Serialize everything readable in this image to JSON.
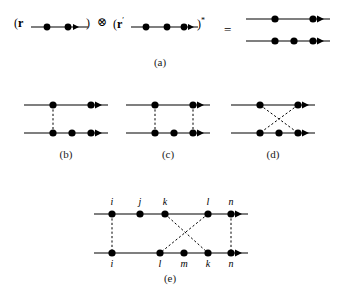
{
  "figure": {
    "caption_labels": [
      "(a)",
      "(b)",
      "(c)",
      "(d)",
      "(e)"
    ],
    "equation_symbols": {
      "tensor_product": "⊗",
      "equals": "=",
      "conjugate": "*",
      "open_paren": "(",
      "close_paren": ")"
    }
  },
  "panel_a": {
    "label": "(a)",
    "left_term_prefix": "(",
    "left_term_symbol": "r",
    "tensor_symbol": "⊗",
    "right_term_prefix": "(",
    "right_term_symbol": "r",
    "right_term_prime": "′",
    "right_term_conjugate": "*",
    "equals": "=",
    "left_propagator_vertices": 2,
    "right_propagator_vertices": 3,
    "result_top_line_vertices": 2,
    "result_bottom_line_vertices": 3
  },
  "panel_b": {
    "label": "(b)",
    "top_vertices": 2,
    "bottom_vertices": 3,
    "interaction_lines": [
      {
        "from": "top-1",
        "to": "bottom-1",
        "style": "dashed"
      }
    ]
  },
  "panel_c": {
    "label": "(c)",
    "top_vertices": 2,
    "bottom_vertices": 3,
    "interaction_lines": [
      {
        "from": "top-1",
        "to": "bottom-1",
        "style": "dashed"
      },
      {
        "from": "top-2",
        "to": "bottom-3",
        "style": "dashed"
      }
    ]
  },
  "panel_d": {
    "label": "(d)",
    "top_vertices": 2,
    "bottom_vertices": 3,
    "interaction_lines": [
      {
        "from": "top-1",
        "to": "bottom-3",
        "style": "dashed"
      },
      {
        "from": "top-2",
        "to": "bottom-1",
        "style": "dashed"
      }
    ]
  },
  "panel_e": {
    "label": "(e)",
    "top_labels": [
      "i",
      "j",
      "k",
      "l",
      "n"
    ],
    "bottom_labels": [
      "i",
      "l",
      "m",
      "k",
      "n"
    ],
    "top_vertices": 5,
    "bottom_vertices": 5,
    "interaction_lines": [
      {
        "from": "top-i",
        "to": "bottom-i",
        "style": "dashed"
      },
      {
        "from": "top-k",
        "to": "bottom-k",
        "style": "dashed"
      },
      {
        "from": "top-l",
        "to": "bottom-l",
        "style": "dashed"
      },
      {
        "from": "top-n",
        "to": "bottom-n",
        "style": "dashed"
      }
    ]
  },
  "colors": {
    "ink": "#000000",
    "background": "#ffffff"
  }
}
